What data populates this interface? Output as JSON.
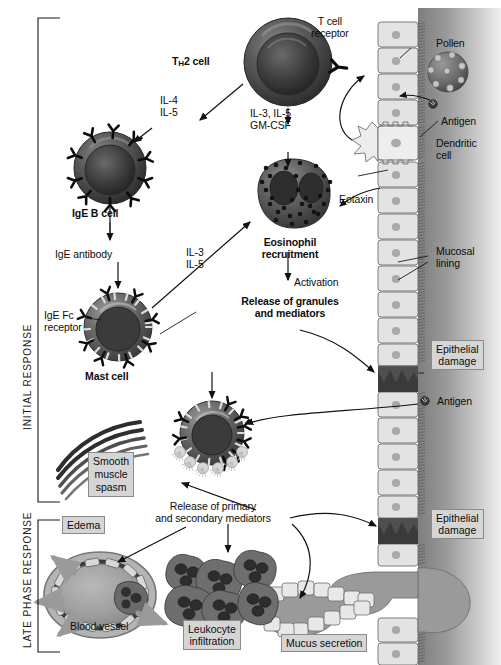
{
  "figure": {
    "type": "biomedical-diagram"
  },
  "phases": [
    {
      "id": "initial",
      "label": "INITIAL RESPONSE"
    },
    {
      "id": "late",
      "label": "LATE PHASE RESPONSE"
    }
  ],
  "cells": {
    "th2": {
      "label_pre": "T",
      "label_sub": "H",
      "label_post": "2 cell"
    },
    "bcell": {
      "label": "IgE B cell"
    },
    "mast": {
      "label": "Mast cell"
    },
    "eosinophil": {
      "label": "Eosinophil\nrecruitment"
    },
    "dendritic": {
      "label": "Dendritic\ncell"
    }
  },
  "labels": {
    "t_cell_receptor": "T cell\nreceptor",
    "pollen": "Pollen",
    "antigen_top": "Antigen",
    "antigen_mid": "Antigen",
    "il4_il5": "IL-4\nIL-5",
    "il3_il5_gmcsf": "IL-3, IL-5\nGM-CSF",
    "il3_il5": "IL-3\nIL-5",
    "ige_antibody": "IgE antibody",
    "ige_fc_receptor": "IgE Fc\nreceptor",
    "eotaxin": "Eotaxin",
    "mucosal_lining": "Mucosal\nlining",
    "activation": "Activation",
    "release_granules": "Release of granules\nand mediators",
    "release_mediators": "Release of primary\nand secondary mediators",
    "blood_vessel": "Blood vessel"
  },
  "boxes": {
    "epithelial_damage_1": "Epithelial\ndamage",
    "epithelial_damage_2": "Epithelial\ndamage",
    "smooth_muscle_spasm": "Smooth\nmuscle\nspasm",
    "edema": "Edema",
    "leukocyte_infiltration": "Leukocyte\ninfiltration",
    "mucus_secretion": "Mucus secretion"
  },
  "colors": {
    "cell_dark": "#3a3a3a",
    "cell_mid": "#6b6b6b",
    "epithelium_fill": "#e2e2e2",
    "epithelium_stroke": "#6f6f6f",
    "tissue_dark": "#8d8d8d",
    "box_fill": "#d5d5d5",
    "box_stroke": "#8a8a8a",
    "arrow": "#111111",
    "damage": "#4d4d4d",
    "mucus": "#9a9a9a"
  }
}
